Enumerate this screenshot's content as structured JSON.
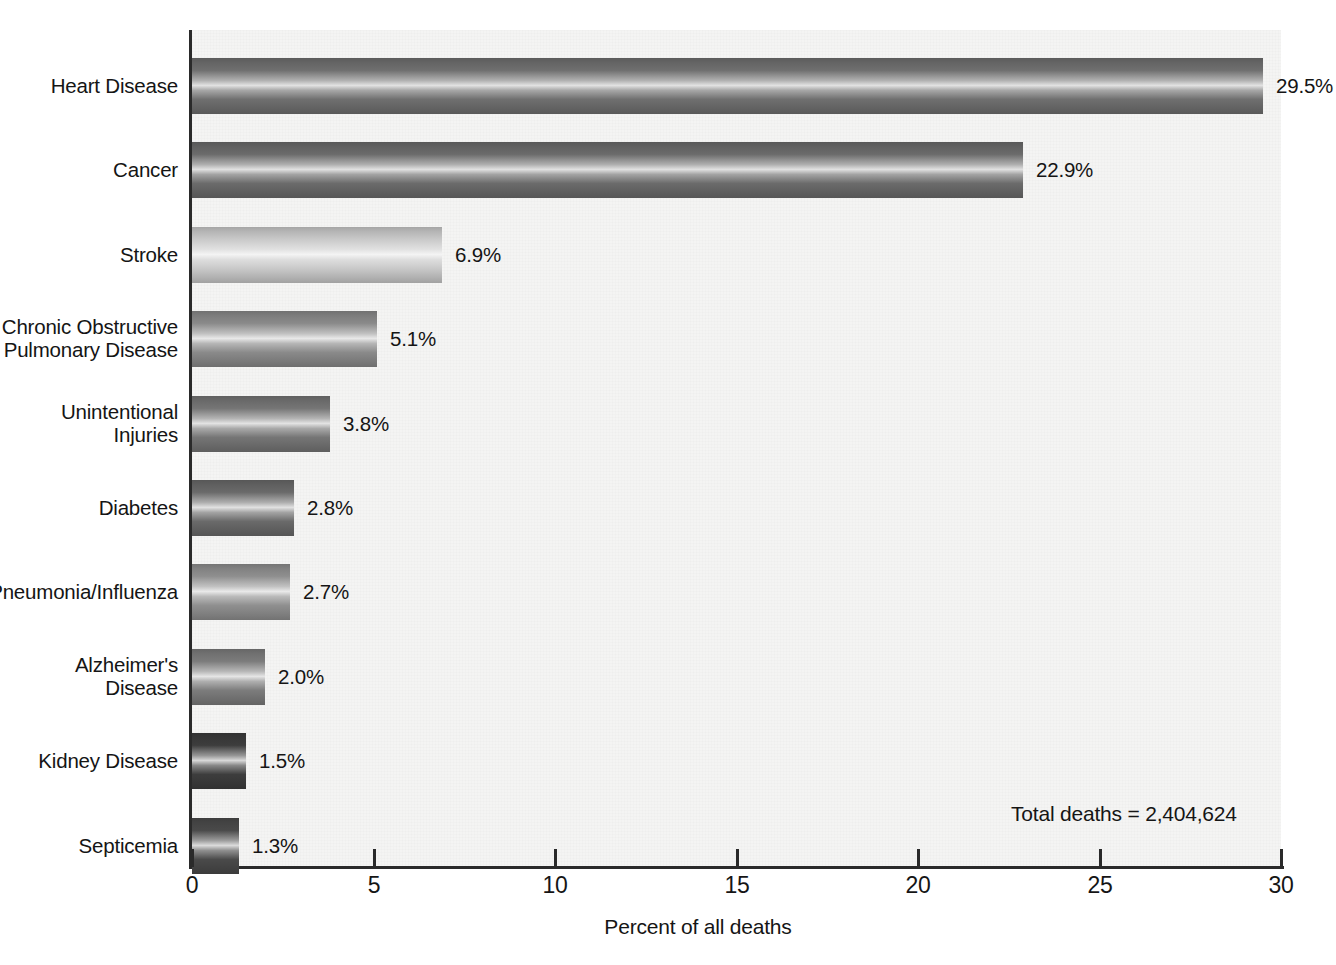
{
  "chart_data": {
    "type": "bar",
    "orientation": "horizontal",
    "title": "",
    "xlabel": "Percent of all deaths",
    "ylabel": "",
    "xlim": [
      0,
      30
    ],
    "xticks": [
      "0",
      "5",
      "10",
      "15",
      "20",
      "25",
      "30"
    ],
    "grid": false,
    "legend": null,
    "categories": [
      "Heart Disease",
      "Cancer",
      "Stroke",
      "Chronic Obstructive\nPulmonary Disease",
      "Unintentional Injuries",
      "Diabetes",
      "Pneumonia/Influenza",
      "Alzheimer's\nDisease",
      "Kidney Disease",
      "Septicemia"
    ],
    "values": [
      29.5,
      22.9,
      6.9,
      5.1,
      3.8,
      2.8,
      2.7,
      2.0,
      1.5,
      1.3
    ],
    "data_labels": [
      "29.5%",
      "22.9%",
      "6.9%",
      "5.1%",
      "3.8%",
      "2.8%",
      "2.7%",
      "2.0%",
      "1.5%",
      "1.3%"
    ],
    "bar_shades": [
      "#6f6f6f",
      "#6b6b6b",
      "#c9c9c9",
      "#8a8a8a",
      "#757575",
      "#6a6a6a",
      "#8f8f8f",
      "#7c7c7c",
      "#3d3d3d",
      "#4a4a4a"
    ],
    "annotations": [
      {
        "text": "Total deaths = 2,404,624"
      }
    ]
  },
  "axis": {
    "x_title": "Percent of all deaths"
  },
  "note": {
    "total_deaths": "Total deaths = 2,404,624"
  },
  "caption": {
    "bottom": ""
  },
  "colors": {
    "plot_background": "#f4f4f3",
    "axis": "#2a2a2a",
    "text": "#151515"
  }
}
